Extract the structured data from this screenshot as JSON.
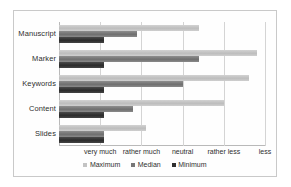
{
  "chart_data": {
    "type": "bar",
    "orientation": "horizontal",
    "title": "",
    "xlabel": "",
    "ylabel": "",
    "grid": true,
    "legend_position": "bottom",
    "categories": [
      "Manuscript",
      "Marker",
      "Keywords",
      "Content",
      "Slides"
    ],
    "x_tick_labels": [
      "very much",
      "rather much",
      "neutral",
      "rather less",
      "less"
    ],
    "x_tick_values": [
      1,
      2,
      3,
      4,
      5
    ],
    "xlim": [
      0,
      5
    ],
    "series": [
      {
        "name": "Maximum",
        "color": "#c3c3c3",
        "values": [
          3.4,
          4.8,
          4.6,
          4.0,
          2.1
        ]
      },
      {
        "name": "Median",
        "color": "#777777",
        "values": [
          1.9,
          3.4,
          3.0,
          1.8,
          1.1
        ]
      },
      {
        "name": "Minimum",
        "color": "#2f2f2f",
        "values": [
          1.1,
          1.1,
          1.1,
          1.1,
          1.1
        ]
      }
    ]
  },
  "legend": {
    "items": [
      {
        "label": "Maximum"
      },
      {
        "label": "Median"
      },
      {
        "label": "Minimum"
      }
    ]
  }
}
